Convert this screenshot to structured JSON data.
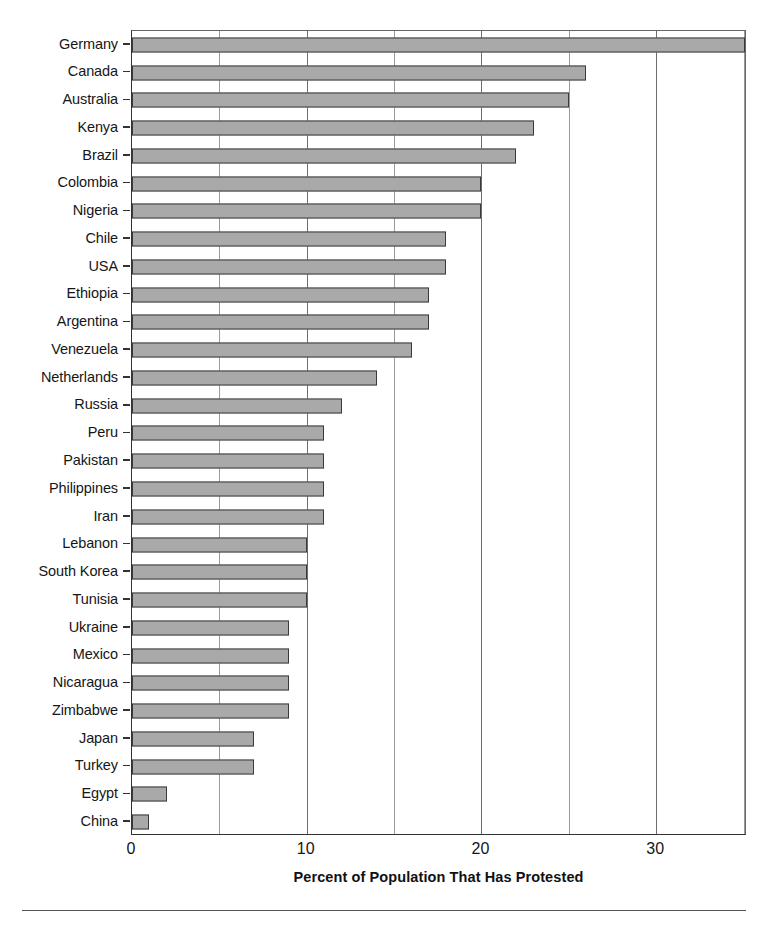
{
  "chart_data": {
    "type": "bar",
    "orientation": "horizontal",
    "title": "",
    "xlabel": "Percent of Population That Has Protested",
    "ylabel": "",
    "xlim": [
      0,
      35.2
    ],
    "ylim": null,
    "xticks": [
      0,
      10,
      20,
      30
    ],
    "xticklabels": [
      "0",
      "10",
      "20",
      "30"
    ],
    "gridlines_x": [
      5,
      10,
      15,
      20,
      25,
      30,
      35
    ],
    "grid": "vertical-minor-and-major",
    "legend": null,
    "legend_position": "none",
    "bar_color": "#a9a9a9",
    "bar_edge_color": "#3a3a3a",
    "categories": [
      "Germany",
      "Canada",
      "Australia",
      "Kenya",
      "Brazil",
      "Colombia",
      "Nigeria",
      "Chile",
      "USA",
      "Ethiopia",
      "Argentina",
      "Venezuela",
      "Netherlands",
      "Russia",
      "Peru",
      "Pakistan",
      "Philippines",
      "Iran",
      "Lebanon",
      "South Korea",
      "Tunisia",
      "Ukraine",
      "Mexico",
      "Nicaragua",
      "Zimbabwe",
      "Japan",
      "Turkey",
      "Egypt",
      "China"
    ],
    "values": [
      35.1,
      26.0,
      25.0,
      23.0,
      22.0,
      20.0,
      20.0,
      18.0,
      18.0,
      17.0,
      17.0,
      16.0,
      14.0,
      12.0,
      11.0,
      11.0,
      11.0,
      11.0,
      10.0,
      10.0,
      10.0,
      9.0,
      9.0,
      9.0,
      9.0,
      7.0,
      7.0,
      2.0,
      1.0
    ]
  },
  "axis": {
    "x_title": "Percent of Population That Has Protested"
  }
}
